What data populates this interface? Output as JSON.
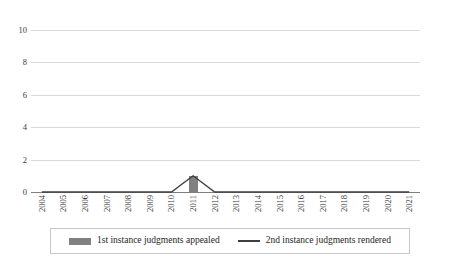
{
  "chart_data": {
    "type": "bar",
    "title": "",
    "subtitle": "",
    "xlabel": "",
    "ylabel": "",
    "categories": [
      "2004",
      "2005",
      "2006",
      "2007",
      "2008",
      "2009",
      "2010",
      "2011",
      "2012",
      "2013",
      "2014",
      "2015",
      "2016",
      "2017",
      "2018",
      "2019",
      "2020",
      "2021"
    ],
    "series": [
      {
        "name": "1st instance judgments appealed",
        "type": "bar",
        "color": "#808080",
        "values": [
          0,
          0,
          0,
          0,
          0,
          0,
          0,
          1,
          0,
          0,
          0,
          0,
          0,
          0,
          0,
          0,
          0,
          0
        ]
      },
      {
        "name": "2nd instance judgments rendered",
        "type": "line",
        "color": "#3f3f3f",
        "values": [
          0,
          0,
          0,
          0,
          0,
          0,
          0,
          1,
          0,
          0,
          0,
          0,
          0,
          0,
          0,
          0,
          0,
          0
        ]
      }
    ],
    "ylim": [
      0,
      10
    ],
    "yticks": [
      0,
      2,
      4,
      6,
      8,
      10
    ],
    "ytick_labels": [
      "0",
      "2",
      "4",
      "6",
      "8",
      "10"
    ],
    "grid": true,
    "grid_axis": "y",
    "legend_position": "bottom"
  },
  "legend": {
    "items": [
      {
        "label": "1st instance judgments appealed",
        "marker": "bar-swatch"
      },
      {
        "label": "2nd instance judgments rendered",
        "marker": "line-swatch"
      }
    ]
  }
}
